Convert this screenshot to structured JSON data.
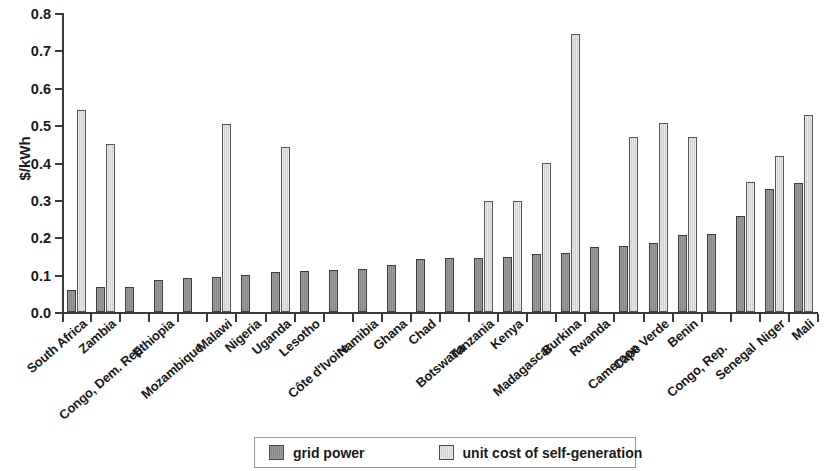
{
  "chart_data": {
    "type": "bar",
    "title": "",
    "xlabel": "",
    "ylabel": "$/kWh",
    "ylim": [
      0,
      0.8
    ],
    "ytick_labels": [
      "0.0",
      "0.1",
      "0.2",
      "0.3",
      "0.4",
      "0.5",
      "0.6",
      "0.7",
      "0.8"
    ],
    "ytick_values": [
      0,
      0.1,
      0.2,
      0.3,
      0.4,
      0.5,
      0.6,
      0.7,
      0.8
    ],
    "grid": false,
    "legend_position": "bottom",
    "categories": [
      "South Africa",
      "Zambia",
      "Congo, Dem. Rep.",
      "Ethiopia",
      "Mozambique",
      "Malawi",
      "Nigeria",
      "Uganda",
      "Lesotho",
      "Côte d'Ivoire",
      "Namibia",
      "Ghana",
      "Chad",
      "Botswana",
      "Tanzania",
      "Kenya",
      "Madagascar",
      "Burkina",
      "Rwanda",
      "Cameroon",
      "Cape Verde",
      "Benin",
      "Congo, Rep.",
      "Senegal",
      "Niger",
      "Mali"
    ],
    "series": [
      {
        "name": "grid power",
        "color": "#8e8e8e",
        "values": [
          0.06,
          0.066,
          0.068,
          0.085,
          0.09,
          0.093,
          0.1,
          0.106,
          0.111,
          0.113,
          0.116,
          0.127,
          0.141,
          0.145,
          0.145,
          0.147,
          0.156,
          0.157,
          0.173,
          0.177,
          0.184,
          0.207,
          0.21,
          0.258,
          0.33,
          0.345
        ]
      },
      {
        "name": "unit cost of self-generation",
        "color": "#d8d8d8",
        "values": [
          0.54,
          0.45,
          null,
          null,
          null,
          0.503,
          null,
          0.441,
          null,
          null,
          null,
          null,
          null,
          null,
          0.298,
          0.298,
          0.398,
          0.745,
          null,
          0.467,
          0.507,
          0.467,
          null,
          0.348,
          0.417,
          0.527
        ]
      }
    ]
  },
  "legend": {
    "items": [
      {
        "label": "grid power",
        "swatch": "dark-gray-square"
      },
      {
        "label": "unit cost of self-generation",
        "swatch": "light-gray-square"
      }
    ]
  }
}
